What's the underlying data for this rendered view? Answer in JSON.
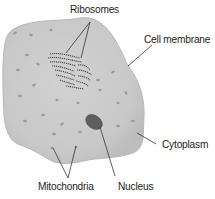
{
  "diagram": {
    "colors": {
      "cell_fill": "#c9c9c9",
      "cell_edge": "#b5b5b5",
      "nucleus": "#5e5e5e",
      "organelle": "#9a9a9a",
      "leader_line": "#333333",
      "text": "#222222"
    },
    "labels": {
      "ribosomes": "Ribosomes",
      "cell_membrane": "Cell membrane",
      "cytoplasm": "Cytoplasm",
      "mitochondria": "Mitochondria",
      "nucleus": "Nucleus"
    }
  }
}
